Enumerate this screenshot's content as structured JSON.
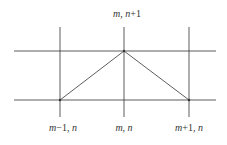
{
  "diagram": {
    "labels": {
      "top": {
        "var": "m",
        "sep": ",  ",
        "var2": "n",
        "suffix": "+1"
      },
      "bottom_left": {
        "var": "m",
        "suffix": "−1",
        "sep": ",  ",
        "var2": "n"
      },
      "bottom_center": {
        "var": "m",
        "sep": ",  ",
        "var2": "n"
      },
      "bottom_right": {
        "var": "m",
        "suffix": "+1",
        "sep": ",  ",
        "var2": "n"
      }
    },
    "colors": {
      "line": "#333333",
      "background": "#ffffff"
    }
  }
}
